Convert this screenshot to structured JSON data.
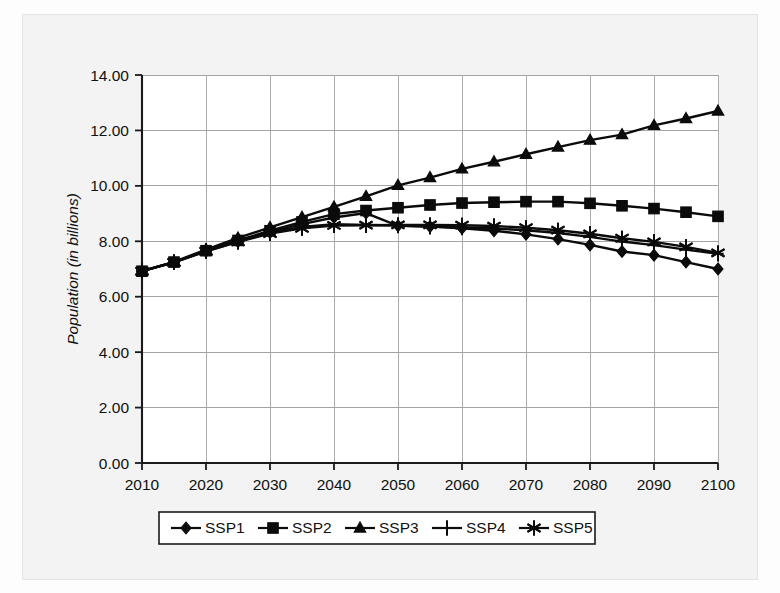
{
  "chart_data": {
    "type": "line",
    "title": "",
    "subtitle": "",
    "xlabel": "",
    "ylabel": "Population (in billions)",
    "x": [
      2010,
      2015,
      2020,
      2025,
      2030,
      2035,
      2040,
      2045,
      2050,
      2055,
      2060,
      2065,
      2070,
      2075,
      2080,
      2085,
      2090,
      2095,
      2100
    ],
    "xtick_labels": [
      "2010",
      "2020",
      "2030",
      "2040",
      "2050",
      "2060",
      "2070",
      "2080",
      "2090",
      "2100"
    ],
    "xticks": [
      2010,
      2020,
      2030,
      2040,
      2050,
      2060,
      2070,
      2080,
      2090,
      2100
    ],
    "ytick_labels": [
      "0.00",
      "2.00",
      "4.00",
      "6.00",
      "8.00",
      "10.00",
      "12.00",
      "14.00"
    ],
    "yticks": [
      0,
      2,
      4,
      6,
      8,
      10,
      12,
      14
    ],
    "xlim": [
      2010,
      2100
    ],
    "ylim": [
      0,
      14
    ],
    "grid": "both",
    "legend_position": "bottom-outside",
    "series": [
      {
        "name": "SSP1",
        "marker": "diamond",
        "values": [
          6.92,
          7.24,
          7.64,
          7.99,
          8.32,
          8.62,
          8.86,
          9.02,
          8.56,
          8.53,
          8.47,
          8.38,
          8.25,
          8.08,
          7.87,
          7.63,
          7.5,
          7.25,
          7.0
        ]
      },
      {
        "name": "SSP2",
        "marker": "square",
        "values": [
          6.92,
          7.25,
          7.66,
          8.03,
          8.38,
          8.7,
          8.98,
          9.11,
          9.21,
          9.31,
          9.38,
          9.41,
          9.43,
          9.43,
          9.37,
          9.28,
          9.18,
          9.05,
          8.9
        ]
      },
      {
        "name": "SSP3",
        "marker": "triangle",
        "values": [
          6.92,
          7.26,
          7.7,
          8.12,
          8.5,
          8.87,
          9.24,
          9.62,
          10.02,
          10.3,
          10.61,
          10.87,
          11.14,
          11.4,
          11.65,
          11.85,
          12.18,
          12.43,
          12.7
        ]
      },
      {
        "name": "SSP4",
        "marker": "plus",
        "values": [
          6.92,
          7.25,
          7.66,
          8.02,
          8.3,
          8.52,
          8.62,
          8.59,
          8.57,
          8.53,
          8.5,
          8.46,
          8.4,
          8.3,
          8.16,
          7.99,
          7.86,
          7.7,
          7.55
        ]
      },
      {
        "name": "SSP5",
        "marker": "asterisk",
        "values": [
          6.92,
          7.24,
          7.64,
          7.98,
          8.28,
          8.47,
          8.57,
          8.58,
          8.59,
          8.59,
          8.58,
          8.55,
          8.49,
          8.4,
          8.27,
          8.11,
          7.98,
          7.8,
          7.58
        ]
      }
    ],
    "legend_entries": [
      {
        "label": "SSP1",
        "marker": "diamond"
      },
      {
        "label": "SSP2",
        "marker": "square"
      },
      {
        "label": "SSP3",
        "marker": "triangle"
      },
      {
        "label": "SSP4",
        "marker": "plus"
      },
      {
        "label": "SSP5",
        "marker": "asterisk"
      }
    ],
    "colors": {
      "line": "#0b0b0b",
      "grid": "#9a9a9a",
      "axis": "#1a1a1a",
      "background": "#f3f3f3",
      "plot_background": "#ffffff"
    }
  }
}
